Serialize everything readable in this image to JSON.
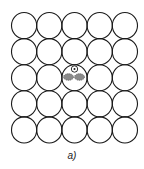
{
  "figure": {
    "caption": "a)",
    "grid": {
      "rows": 5,
      "cols": 5,
      "origin_x": 11.5,
      "origin_y": 12.5,
      "cell_w": 25.2,
      "cell_h": 26.1
    },
    "center_cell": {
      "row": 2,
      "col": 2,
      "small_circle": {
        "cx": 74.5,
        "cy": 69,
        "r": 3.2,
        "dot_r": 1
      },
      "ellipses": [
        {
          "cx": 68.5,
          "cy": 77,
          "rx": 5,
          "ry": 3.3
        },
        {
          "cx": 79.5,
          "cy": 77,
          "rx": 5,
          "ry": 3.3
        }
      ]
    },
    "colors": {
      "stroke": "#1a1a1a",
      "ellipse_fill": "#8a8a8a"
    }
  }
}
